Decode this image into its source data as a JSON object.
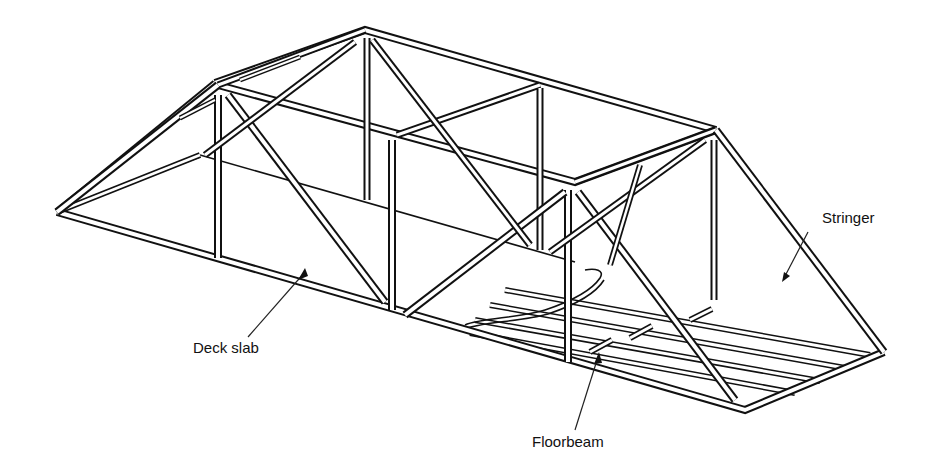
{
  "figure": {
    "colors": {
      "ink": "#111111",
      "background": "#ffffff"
    }
  },
  "labels": {
    "deck_slab": "Deck slab",
    "stringer": "Stringer",
    "floorbeam": "Floorbeam"
  }
}
